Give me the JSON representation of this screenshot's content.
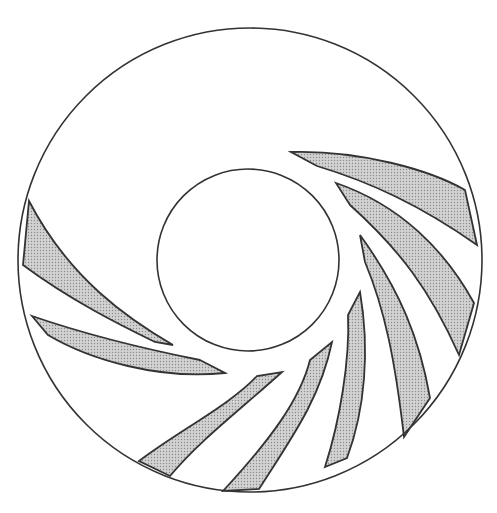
{
  "diagram": {
    "type": "impeller-vane-cross-section",
    "colors": {
      "background": "#ffffff",
      "stroke": "#333333",
      "vane_fill": "#c8c8c8",
      "vane_dot": "#8a8a8a"
    },
    "outer_circle": {
      "cx": 250,
      "cy": 260,
      "r": 232
    },
    "inner_circle": {
      "cx": 248,
      "cy": 260,
      "r": 91
    },
    "vane_count": 8,
    "vanes": [
      {
        "id": "vane-1",
        "d": "M291,152 C360,150 430,170 465,190 L477,245 C420,205 370,182 317,166 Z"
      },
      {
        "id": "vane-2",
        "d": "M336,183 C400,205 445,250 474,303 L459,355 C430,290 400,250 350,205 Z"
      },
      {
        "id": "vane-3",
        "d": "M360,235 C400,290 420,340 430,398 L404,437 C395,360 385,310 365,262 Z"
      },
      {
        "id": "vane-4",
        "d": "M360,292 C370,350 365,410 347,458 L325,467 C340,420 350,360 348,315 Z"
      },
      {
        "id": "vane-5",
        "d": "M332,342 C320,400 290,440 259,489 L223,491 C270,440 300,400 310,360 Z"
      },
      {
        "id": "vane-6",
        "d": "M282,372 C240,410 200,440 170,476 L139,461 C180,430 230,405 257,376 Z"
      },
      {
        "id": "vane-7",
        "d": "M225,373 C160,380 90,360 48,335 L32,316 C90,336 160,352 200,360 Z"
      },
      {
        "id": "vane-8",
        "d": "M173,345 C130,320 70,280 29,201 L23,265 C70,300 120,325 155,342 Z"
      }
    ]
  }
}
